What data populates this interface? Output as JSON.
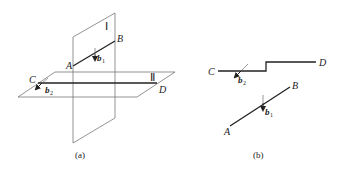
{
  "figure_a": {
    "caption": "(a)",
    "plane_1_label": "Ⅰ",
    "plane_2_label": "Ⅱ",
    "point_A": "A",
    "point_B": "B",
    "point_C": "C",
    "point_D": "D",
    "vector_b1": "b",
    "vector_b1_sub": "1",
    "vector_b2": "b",
    "vector_b2_sub": "2"
  },
  "figure_b": {
    "caption": "(b)",
    "point_A": "A",
    "point_B": "B",
    "point_C": "C",
    "point_D": "D",
    "vector_b1": "b",
    "vector_b1_sub": "1",
    "vector_b2": "b",
    "vector_b2_sub": "2"
  },
  "colors": {
    "line": "#555555",
    "thick_line": "#222222"
  }
}
